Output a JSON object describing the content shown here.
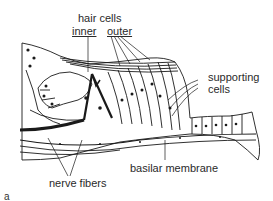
{
  "diagram": {
    "type": "anatomical-illustration",
    "labels": {
      "hair_cells": "hair cells",
      "inner": "inner",
      "outer": "outer",
      "supporting_cells_1": "supporting",
      "supporting_cells_2": "cells",
      "basilar_membrane": "basilar membrane",
      "nerve_fibers": "nerve fibers"
    },
    "figure_mark": "a",
    "colors": {
      "ink": "#1a1a1a",
      "paper": "#ffffff",
      "label": "#2a2a2a"
    }
  }
}
